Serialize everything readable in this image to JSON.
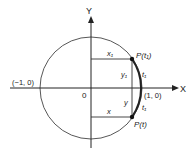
{
  "diagram": {
    "axes": {
      "x_label": "X",
      "y_label": "Y",
      "origin_label": "0"
    },
    "circle": {
      "left_point": "(−1, 0)",
      "right_point": "(1, 0)"
    },
    "points": {
      "upper": {
        "label": "P(t₁)",
        "arc_label": "t₁",
        "x_label": "x₁",
        "y_label": "y₁"
      },
      "lower": {
        "label": "P(t)",
        "arc_label": "t₁",
        "x_label": "x",
        "y_label": "y"
      }
    },
    "colors": {
      "stroke": "#333333",
      "background": "#ffffff"
    }
  }
}
